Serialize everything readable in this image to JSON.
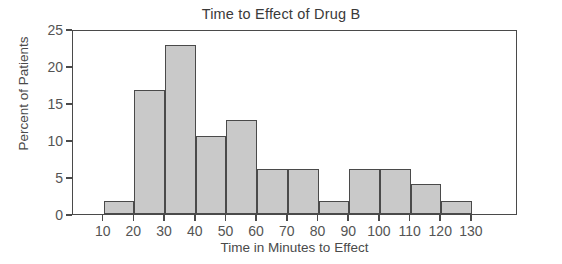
{
  "chart_data": {
    "type": "bar",
    "title": "Time to Effect of Drug B",
    "xlabel": "Time in Minutes to Effect",
    "ylabel": "Percent of Patients",
    "xlim": [
      0,
      145
    ],
    "ylim": [
      0,
      25
    ],
    "grid": false,
    "legend": null,
    "bin_width": 10,
    "bin_edges": [
      10,
      20,
      30,
      40,
      50,
      60,
      70,
      80,
      90,
      100,
      110,
      120,
      130
    ],
    "categories": [
      "10-20",
      "20-30",
      "30-40",
      "40-50",
      "50-60",
      "60-70",
      "70-80",
      "80-90",
      "90-100",
      "100-110",
      "110-120",
      "120-130"
    ],
    "values": [
      1.8,
      16.7,
      22.8,
      10.6,
      12.7,
      6.1,
      6.1,
      1.8,
      6.1,
      6.1,
      4.0,
      1.8
    ],
    "xticks": [
      10,
      20,
      30,
      40,
      50,
      60,
      70,
      80,
      90,
      100,
      110,
      120,
      130
    ],
    "xtick_labels": [
      "10",
      "20",
      "30",
      "40",
      "50",
      "60",
      "70",
      "80",
      "90",
      "100",
      "110",
      "120",
      "130"
    ],
    "yticks": [
      0,
      5,
      10,
      15,
      20,
      25
    ],
    "ytick_labels": [
      "0",
      "5",
      "10",
      "15",
      "20",
      "25"
    ],
    "bar_fill_color": "#c9c9c9",
    "bar_edge_color": "#4a4a4a",
    "frame_color": "#4a4a4a",
    "background_color": "#ffffff"
  }
}
